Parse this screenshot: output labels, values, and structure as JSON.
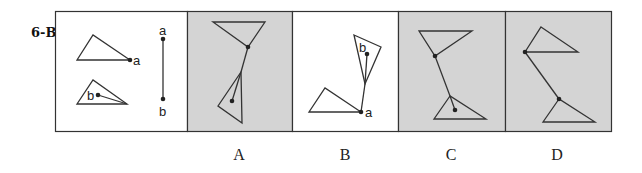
{
  "question": {
    "label": "6-B"
  },
  "colors": {
    "panel_fill_shaded": "#d4d4d4",
    "panel_fill_white": "#ffffff",
    "stroke": "#333333"
  },
  "reference_panel": {
    "labels": {
      "triangle1_point": "a",
      "triangle2_point": "b",
      "segment_top": "a",
      "segment_bottom": "b"
    }
  },
  "options": [
    {
      "label": "A",
      "shaded": true
    },
    {
      "label": "B",
      "shaded": false,
      "point_labels": [
        "b",
        "a"
      ]
    },
    {
      "label": "C",
      "shaded": true
    },
    {
      "label": "D",
      "shaded": true
    }
  ]
}
